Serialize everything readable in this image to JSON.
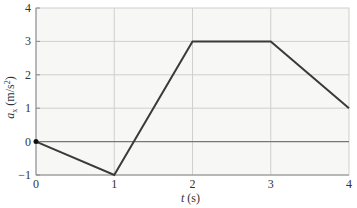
{
  "chart_data": {
    "type": "line",
    "title": "",
    "xlabel": "t (s)",
    "ylabel": "a_x (m/s²)",
    "ylabel_parts": {
      "var": "a",
      "sub": "x",
      "unit_pre": " (m/s",
      "sup": "2",
      "unit_post": ")"
    },
    "xlabel_parts": {
      "var": "t",
      "unit": " (s)"
    },
    "xlim": [
      0,
      4
    ],
    "ylim": [
      -1,
      4
    ],
    "xticks": [
      0,
      1,
      2,
      3,
      4
    ],
    "yticks": [
      -1,
      0,
      1,
      2,
      3,
      4
    ],
    "xtick_labels": [
      "0",
      "1",
      "2",
      "3",
      "4"
    ],
    "ytick_labels": [
      "−1",
      "0",
      "1",
      "2",
      "3",
      "4"
    ],
    "grid": true,
    "legend": null,
    "series": [
      {
        "name": "a_x(t)",
        "x": [
          0,
          1,
          2,
          3,
          4
        ],
        "y": [
          0,
          -1,
          3,
          3,
          1
        ],
        "color": "#3a3a3a"
      }
    ],
    "start_marker": {
      "x": 0,
      "y": 0
    },
    "colors": {
      "plot_background": "#f7f7f5",
      "grid": "#cfcfcf",
      "axis": "#8a8a8a",
      "zero_line": "#777777",
      "line": "#3a3a3a"
    }
  }
}
